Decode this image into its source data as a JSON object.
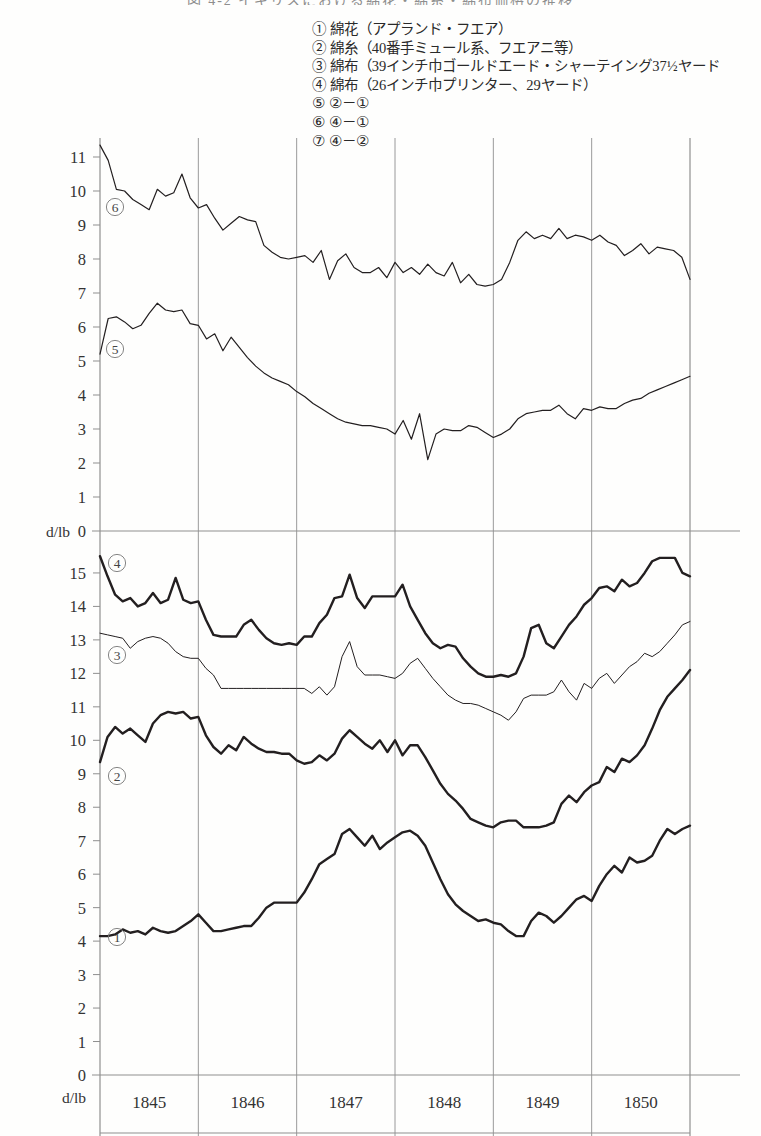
{
  "page": {
    "title_sliver": "図 4-2   イギリスにおける綿花・綿糸・綿布価格の推移",
    "background": "#fefefd",
    "line_color": "#231f20",
    "grid_color": "#8f8f8f"
  },
  "legend": {
    "items": [
      {
        "marker": "①",
        "text": "綿花（アプランド・フエア）"
      },
      {
        "marker": "②",
        "text": "綿糸（40番手ミュール系、フエアニ等）"
      },
      {
        "marker": "③",
        "text": "綿布（39インチ巾ゴールドエード・シャーテイング37½ヤード"
      },
      {
        "marker": "④",
        "text": "綿布（26インチ巾プリンター、29ヤード）"
      },
      {
        "marker": "⑤",
        "text": "②－①"
      },
      {
        "marker": "⑥",
        "text": "④－①"
      },
      {
        "marker": "⑦",
        "text": "④－②"
      }
    ]
  },
  "chart_data": {
    "type": "line",
    "title": "図 4-2   イギリスにおける綿花・綿糸・綿布価格の推移",
    "xlabel": "",
    "ylabel": "d/lb",
    "grid": true,
    "legend_position": "top-right",
    "x_tick_labels": [
      "1845",
      "1846",
      "1847",
      "1848",
      "1849",
      "1850"
    ],
    "x_range": [
      "1844.5",
      "1850.9"
    ],
    "panels": [
      {
        "name": "upper-panel",
        "ylabel": "d/lb",
        "ylim": [
          0,
          11.6
        ],
        "y_tick_labels": [
          "0",
          "1",
          "2",
          "3",
          "4",
          "5",
          "6",
          "7",
          "8",
          "9",
          "10",
          "11"
        ],
        "series": [
          {
            "name": "⑥",
            "label": "④－①",
            "stroke_width": 1.2,
            "values": [
              11.35,
              10.9,
              10.05,
              10.0,
              9.75,
              9.6,
              9.45,
              10.05,
              9.85,
              9.95,
              10.5,
              9.8,
              9.5,
              9.6,
              9.2,
              8.85,
              9.05,
              9.25,
              9.15,
              9.1,
              8.4,
              8.2,
              8.05,
              8.0,
              8.05,
              8.1,
              7.9,
              8.25,
              7.4,
              7.95,
              8.15,
              7.75,
              7.6,
              7.6,
              7.75,
              7.45,
              7.9,
              7.6,
              7.75,
              7.55,
              7.85,
              7.6,
              7.5,
              7.9,
              7.3,
              7.55,
              7.25,
              7.2,
              7.25,
              7.4,
              7.9,
              8.55,
              8.8,
              8.6,
              8.7,
              8.6,
              8.9,
              8.6,
              8.7,
              8.65,
              8.55,
              8.7,
              8.5,
              8.4,
              8.1,
              8.25,
              8.45,
              8.15,
              8.35,
              8.3,
              8.25,
              8.05,
              7.4
            ]
          },
          {
            "name": "⑤",
            "label": "②－①",
            "stroke_width": 1.2,
            "values": [
              5.2,
              6.25,
              6.3,
              6.15,
              5.95,
              6.05,
              6.4,
              6.7,
              6.5,
              6.45,
              6.5,
              6.1,
              6.05,
              5.65,
              5.8,
              5.3,
              5.7,
              5.4,
              5.1,
              4.85,
              4.65,
              4.5,
              4.4,
              4.3,
              4.1,
              3.95,
              3.75,
              3.6,
              3.45,
              3.3,
              3.2,
              3.15,
              3.1,
              3.1,
              3.05,
              3.0,
              2.85,
              3.25,
              2.7,
              3.45,
              2.1,
              2.85,
              3.0,
              2.95,
              2.95,
              3.1,
              3.05,
              2.9,
              2.75,
              2.85,
              3.0,
              3.3,
              3.45,
              3.5,
              3.55,
              3.55,
              3.7,
              3.45,
              3.3,
              3.6,
              3.55,
              3.65,
              3.6,
              3.6,
              3.75,
              3.85,
              3.9,
              4.05,
              4.15,
              4.25,
              4.35,
              4.45,
              4.55
            ]
          }
        ]
      },
      {
        "name": "lower-panel",
        "ylabel": "d/lb",
        "ylim": [
          0,
          15.6
        ],
        "y_tick_labels": [
          "0",
          "1",
          "2",
          "3",
          "4",
          "5",
          "6",
          "7",
          "8",
          "9",
          "10",
          "11",
          "12",
          "13",
          "14",
          "15"
        ],
        "series": [
          {
            "name": "④",
            "label": "綿布（26インチ巾プリンター、29ヤード）",
            "stroke_width": 2.4,
            "values": [
              15.5,
              14.9,
              14.35,
              14.15,
              14.25,
              14.0,
              14.1,
              14.4,
              14.1,
              14.2,
              14.85,
              14.2,
              14.1,
              14.15,
              13.6,
              13.15,
              13.1,
              13.1,
              13.1,
              13.45,
              13.6,
              13.3,
              13.05,
              12.9,
              12.85,
              12.9,
              12.85,
              13.1,
              13.1,
              13.5,
              13.75,
              14.25,
              14.3,
              14.95,
              14.25,
              13.95,
              14.3,
              14.3,
              14.3,
              14.3,
              14.65,
              14.0,
              13.6,
              13.2,
              12.9,
              12.75,
              12.85,
              12.8,
              12.45,
              12.2,
              12.0,
              11.9,
              11.9,
              11.95,
              11.9,
              12.0,
              12.5,
              13.35,
              13.45,
              12.9,
              12.75,
              13.1,
              13.45,
              13.7,
              14.05,
              14.25,
              14.55,
              14.6,
              14.45,
              14.8,
              14.6,
              14.7,
              15.0,
              15.35,
              15.45,
              15.45,
              15.45,
              15.0,
              14.9
            ]
          },
          {
            "name": "③",
            "label": "綿布（39インチ巾ゴールドエード・シャーテイング37½ヤード）",
            "stroke_width": 1.0,
            "values": [
              13.2,
              13.15,
              13.1,
              13.05,
              12.75,
              12.95,
              13.05,
              13.1,
              13.05,
              12.9,
              12.65,
              12.5,
              12.45,
              12.45,
              12.15,
              11.95,
              11.55,
              11.55,
              11.55,
              11.55,
              11.55,
              11.55,
              11.55,
              11.55,
              11.55,
              11.55,
              11.55,
              11.55,
              11.4,
              11.6,
              11.35,
              11.6,
              12.5,
              12.95,
              12.2,
              11.95,
              11.95,
              11.95,
              11.9,
              11.85,
              12.0,
              12.3,
              12.45,
              12.15,
              11.85,
              11.6,
              11.35,
              11.2,
              11.1,
              11.1,
              11.05,
              10.95,
              10.85,
              10.75,
              10.6,
              10.85,
              11.25,
              11.35,
              11.35,
              11.35,
              11.45,
              11.8,
              11.45,
              11.2,
              11.7,
              11.55,
              11.85,
              12.0,
              11.7,
              11.95,
              12.2,
              12.35,
              12.6,
              12.5,
              12.65,
              12.9,
              13.15,
              13.45,
              13.55
            ]
          },
          {
            "name": "②",
            "label": "綿糸（40番手ミュール系、フエアニ等）",
            "stroke_width": 2.4,
            "values": [
              9.35,
              10.1,
              10.4,
              10.2,
              10.35,
              10.15,
              9.95,
              10.5,
              10.75,
              10.85,
              10.8,
              10.85,
              10.65,
              10.7,
              10.15,
              9.8,
              9.6,
              9.85,
              9.7,
              10.1,
              9.9,
              9.75,
              9.65,
              9.65,
              9.6,
              9.6,
              9.4,
              9.3,
              9.35,
              9.55,
              9.4,
              9.6,
              10.05,
              10.3,
              10.1,
              9.9,
              9.75,
              10.0,
              9.65,
              10.0,
              9.55,
              9.85,
              9.85,
              9.5,
              9.1,
              8.7,
              8.4,
              8.2,
              7.95,
              7.65,
              7.55,
              7.45,
              7.4,
              7.55,
              7.6,
              7.6,
              7.4,
              7.4,
              7.4,
              7.45,
              7.55,
              8.1,
              8.35,
              8.15,
              8.45,
              8.65,
              8.75,
              9.2,
              9.05,
              9.45,
              9.35,
              9.55,
              9.85,
              10.35,
              10.9,
              11.3,
              11.55,
              11.8,
              12.1
            ]
          },
          {
            "name": "①",
            "label": "綿花（アプランド・フエア）",
            "stroke_width": 2.4,
            "values": [
              4.15,
              4.15,
              4.2,
              4.35,
              4.25,
              4.3,
              4.2,
              4.4,
              4.3,
              4.25,
              4.3,
              4.45,
              4.6,
              4.8,
              4.55,
              4.3,
              4.3,
              4.35,
              4.4,
              4.45,
              4.45,
              4.7,
              5.0,
              5.15,
              5.15,
              5.15,
              5.15,
              5.45,
              5.85,
              6.3,
              6.45,
              6.6,
              7.2,
              7.35,
              7.1,
              6.85,
              7.15,
              6.75,
              6.95,
              7.1,
              7.25,
              7.3,
              7.15,
              6.85,
              6.35,
              5.85,
              5.4,
              5.1,
              4.9,
              4.75,
              4.6,
              4.65,
              4.55,
              4.5,
              4.3,
              4.15,
              4.15,
              4.6,
              4.85,
              4.75,
              4.55,
              4.75,
              5.0,
              5.25,
              5.35,
              5.2,
              5.65,
              6.0,
              6.25,
              6.05,
              6.5,
              6.35,
              6.4,
              6.55,
              7.0,
              7.35,
              7.2,
              7.35,
              7.45
            ]
          }
        ]
      }
    ]
  }
}
